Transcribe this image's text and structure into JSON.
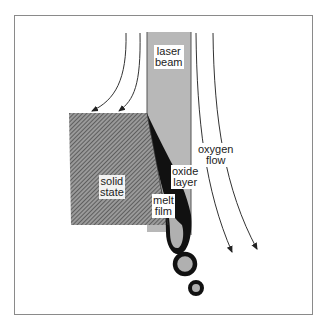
{
  "diagram": {
    "labels": {
      "laser_beam": [
        "laser",
        "beam"
      ],
      "oxygen_flow": [
        "oxygen",
        "flow"
      ],
      "solid_state": [
        "solid",
        "state"
      ],
      "oxide_layer": [
        "oxide",
        "layer"
      ],
      "melt_film": [
        "melt",
        "film"
      ]
    },
    "colors": {
      "beam": "#b8b8b8",
      "solid_hatch": "#555555",
      "melt": "#000000",
      "frame": "#8a8a8a",
      "arrows": "#333333"
    }
  }
}
